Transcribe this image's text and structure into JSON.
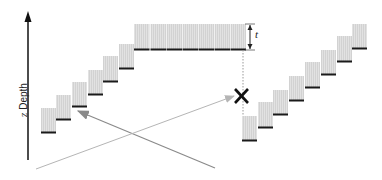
{
  "diagram": {
    "axis": {
      "variable": "z",
      "label": "Depth"
    },
    "thickness_label": "t",
    "colors": {
      "block_fill": "#d2d2d2",
      "block_stripe": "#e6e6e6",
      "block_base": "#1a1a1a",
      "axis": "#111111",
      "arrow_dark": "#8a8a8a",
      "arrow_light": "#b5b5b5",
      "cross": "#111111"
    },
    "left_staircase": [
      {
        "x": 41,
        "top": 108,
        "bottom": 133
      },
      {
        "x": 56,
        "top": 95,
        "bottom": 120
      },
      {
        "x": 72,
        "top": 82,
        "bottom": 107
      },
      {
        "x": 88,
        "top": 70,
        "bottom": 95
      },
      {
        "x": 103,
        "top": 56,
        "bottom": 82
      },
      {
        "x": 119,
        "top": 44,
        "bottom": 69
      }
    ],
    "top_row": {
      "x_start": 134,
      "count": 7,
      "block_width": 16,
      "top": 24,
      "bottom": 50
    },
    "right_staircase": [
      {
        "x": 242,
        "top": 116,
        "bottom": 141
      },
      {
        "x": 258,
        "top": 102,
        "bottom": 128
      },
      {
        "x": 273,
        "top": 90,
        "bottom": 115
      },
      {
        "x": 289,
        "top": 76,
        "bottom": 101
      },
      {
        "x": 305,
        "top": 62,
        "bottom": 88
      },
      {
        "x": 321,
        "top": 50,
        "bottom": 75
      },
      {
        "x": 337,
        "top": 36,
        "bottom": 62
      },
      {
        "x": 352,
        "top": 24,
        "bottom": 49
      }
    ]
  }
}
